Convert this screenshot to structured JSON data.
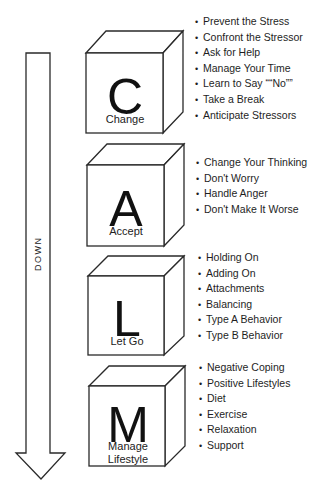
{
  "diagram": {
    "arrow": {
      "label": "DOWN",
      "direction": "down"
    },
    "steps": [
      {
        "letter": "C",
        "label": "Change",
        "items": [
          "Prevent the Stress",
          "Confront the Stressor",
          "Ask for Help",
          "Manage Your Time",
          "Learn to Say ““No””",
          "Take a Break",
          "Anticipate Stressors"
        ]
      },
      {
        "letter": "A",
        "label": "Accept",
        "items": [
          "Change Your Thinking",
          "Don't Worry",
          "Handle Anger",
          "Don't Make It Worse"
        ]
      },
      {
        "letter": "L",
        "label": "Let Go",
        "items": [
          "Holding On",
          "Adding On",
          "Attachments",
          "Balancing",
          "Type A Behavior",
          "Type B Behavior"
        ]
      },
      {
        "letter": "M",
        "label_line1": "Manage",
        "label_line2": "Lifestyle",
        "items": [
          "Negative Coping",
          "Positive Lifestyles",
          "Diet",
          "Exercise",
          "Relaxation",
          "Support"
        ]
      }
    ]
  }
}
